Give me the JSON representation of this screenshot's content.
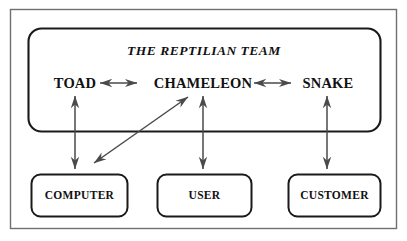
{
  "diagram": {
    "title": "THE REPTILIAN TEAM",
    "team_members": [
      {
        "id": "toad",
        "label": "TOAD"
      },
      {
        "id": "chameleon",
        "label": "CHAMELEON"
      },
      {
        "id": "snake",
        "label": "SNAKE"
      }
    ],
    "external_entities": [
      {
        "id": "computer",
        "label": "COMPUTER"
      },
      {
        "id": "user",
        "label": "USER"
      },
      {
        "id": "customer",
        "label": "CUSTOMER"
      }
    ],
    "connections": [
      {
        "from": "TOAD",
        "to": "CHAMELEON",
        "style": "double-headed-horizontal"
      },
      {
        "from": "CHAMELEON",
        "to": "SNAKE",
        "style": "double-headed-horizontal"
      },
      {
        "from": "TOAD",
        "to": "COMPUTER",
        "style": "double-headed-vertical"
      },
      {
        "from": "CHAMELEON",
        "to": "USER",
        "style": "double-headed-vertical"
      },
      {
        "from": "SNAKE",
        "to": "CUSTOMER",
        "style": "double-headed-vertical"
      },
      {
        "from": "CHAMELEON",
        "to": "COMPUTER",
        "style": "double-headed-diagonal"
      }
    ],
    "colors": {
      "background": "#ffffff",
      "outer_frame_stroke": "#6f6f6f",
      "team_box_stroke": "#1a1a1a",
      "entity_box_stroke": "#1a1a1a",
      "arrow_stroke": "#4a4a4a",
      "text": "#111111"
    }
  }
}
